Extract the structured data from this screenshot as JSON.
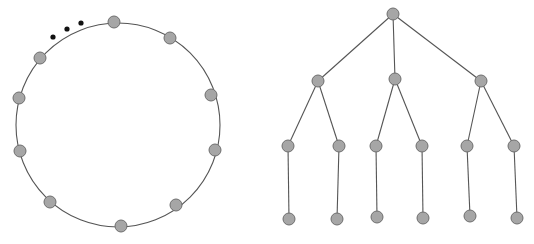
{
  "ring_diagram": {
    "center": [
      118,
      125
    ],
    "radius": 102,
    "nodes": [
      {
        "x": 114,
        "y": 22
      },
      {
        "x": 170,
        "y": 38
      },
      {
        "x": 211,
        "y": 95
      },
      {
        "x": 215,
        "y": 150
      },
      {
        "x": 176,
        "y": 205
      },
      {
        "x": 121,
        "y": 226
      },
      {
        "x": 50,
        "y": 202
      },
      {
        "x": 20,
        "y": 151
      },
      {
        "x": 19,
        "y": 98
      },
      {
        "x": 40,
        "y": 58
      }
    ],
    "ellipsis_dots": [
      {
        "x": 53,
        "y": 37
      },
      {
        "x": 67,
        "y": 29
      },
      {
        "x": 81,
        "y": 23
      }
    ]
  },
  "tree_diagram": {
    "nodes": [
      {
        "id": "root",
        "x": 393,
        "y": 14
      },
      {
        "id": "a",
        "x": 318,
        "y": 81
      },
      {
        "id": "b",
        "x": 395,
        "y": 79
      },
      {
        "id": "c",
        "x": 481,
        "y": 81
      },
      {
        "id": "a1",
        "x": 288,
        "y": 146
      },
      {
        "id": "a2",
        "x": 339,
        "y": 146
      },
      {
        "id": "b1",
        "x": 376,
        "y": 146
      },
      {
        "id": "b2",
        "x": 422,
        "y": 146
      },
      {
        "id": "c1",
        "x": 467,
        "y": 146
      },
      {
        "id": "c2",
        "x": 514,
        "y": 146
      },
      {
        "id": "a1x",
        "x": 289,
        "y": 219
      },
      {
        "id": "a2x",
        "x": 337,
        "y": 219
      },
      {
        "id": "b1x",
        "x": 377,
        "y": 217
      },
      {
        "id": "b2x",
        "x": 423,
        "y": 218
      },
      {
        "id": "c1x",
        "x": 470,
        "y": 216
      },
      {
        "id": "c2x",
        "x": 517,
        "y": 218
      }
    ],
    "edges": [
      [
        "root",
        "a"
      ],
      [
        "root",
        "b"
      ],
      [
        "root",
        "c"
      ],
      [
        "a",
        "a1"
      ],
      [
        "a",
        "a2"
      ],
      [
        "b",
        "b1"
      ],
      [
        "b",
        "b2"
      ],
      [
        "c",
        "c1"
      ],
      [
        "c",
        "c2"
      ],
      [
        "a1",
        "a1x"
      ],
      [
        "a2",
        "a2x"
      ],
      [
        "b1",
        "b1x"
      ],
      [
        "b2",
        "b2x"
      ],
      [
        "c1",
        "c1x"
      ],
      [
        "c2",
        "c2x"
      ]
    ]
  },
  "style": {
    "node_radius": 6,
    "node_fill": "#a6a6a6",
    "node_stroke": "#6e6e6e",
    "edge_color": "#555555",
    "dot_color": "#111111"
  }
}
